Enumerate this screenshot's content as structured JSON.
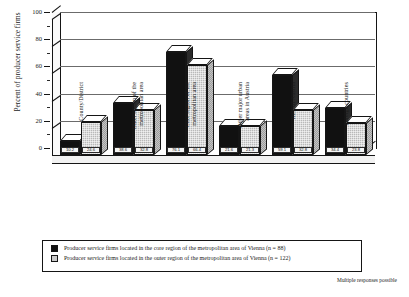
{
  "chart_data": {
    "type": "bar",
    "title": "",
    "xlabel": "",
    "ylabel": "Percent of producer service firms",
    "ylim": [
      0,
      100
    ],
    "yticks": [
      0,
      20,
      40,
      60,
      80,
      100
    ],
    "grid": true,
    "legend_position": "bottom",
    "categories": [
      "County/District",
      "Outer region of the metropolitan area",
      "Core region of the metropolitan area",
      "Other major urban areas in Austria",
      "Rest of Austria",
      "Foreign countries"
    ],
    "categories_lines": [
      [
        "County/District"
      ],
      [
        "Outer region of the",
        "metropolitan area"
      ],
      [
        "Core region of the",
        "metropolitan area"
      ],
      [
        "Other major urban",
        "areas in Austria"
      ],
      [
        "Rest of Austria"
      ],
      [
        "Foreign countries"
      ]
    ],
    "series": [
      {
        "name": "Producer service firms located in the core region of the metropolitan area of Vienna (n = 88)",
        "color": "#111111",
        "values": [
          10.2,
          38.6,
          76.1,
          21.6,
          59.1,
          34.4
        ],
        "labels": [
          "10.2",
          "38.6",
          "76.1",
          "21.6",
          "59.1",
          "34.4"
        ]
      },
      {
        "name": "Producer service firms located in the outer region of the metropolitan area of Vienna (n = 122)",
        "color": "#b9b9b9",
        "values": [
          24.6,
          32.8,
          66.4,
          21.3,
          32.8,
          23.8
        ],
        "labels": [
          "24.6",
          "32.8",
          "66.4",
          "21.3",
          "32.8",
          "23.8"
        ]
      }
    ],
    "annotations": [
      "Multiple responses possible"
    ]
  },
  "axis": {
    "ylabel": "Percent of producer service firms",
    "yticks": [
      "100",
      "80",
      "60",
      "40",
      "20",
      "0"
    ]
  },
  "legend": {
    "entries": [
      "Producer service firms located in the core region of the metropolitan area of Vienna (n = 88)",
      "Producer service firms located in the outer region of the metropolitan area of Vienna (n = 122)"
    ]
  },
  "footnote": "Multiple responses possible"
}
